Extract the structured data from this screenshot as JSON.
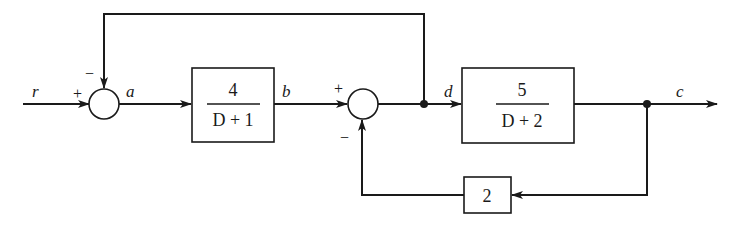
{
  "diagram": {
    "type": "block-diagram",
    "signals": {
      "input": "r",
      "after_sum1": "a",
      "after_block1": "b",
      "after_sum2": "d",
      "output": "c"
    },
    "sum1": {
      "plus": "+",
      "minus": "−"
    },
    "sum2": {
      "plus": "+",
      "minus": "−"
    },
    "block1": {
      "numerator": "4",
      "denominator": "D + 1"
    },
    "block2": {
      "numerator": "5",
      "denominator": "D + 2"
    },
    "feedback_gain": {
      "value": "2"
    }
  }
}
